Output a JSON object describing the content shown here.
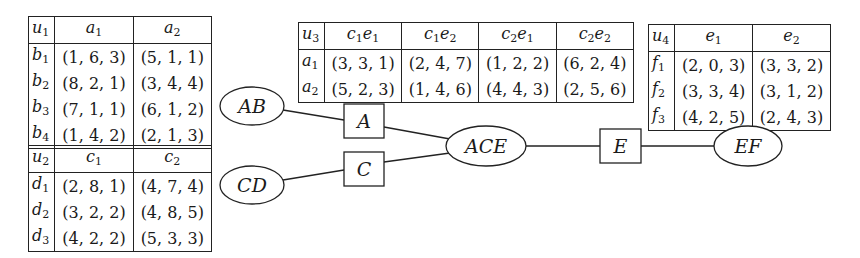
{
  "tables": [
    {
      "id": "u1",
      "corner": {
        "base": "u",
        "sub": "1"
      },
      "columns": [
        {
          "base": "a",
          "sub": "1"
        },
        {
          "base": "a",
          "sub": "2"
        }
      ],
      "rows": [
        {
          "label": {
            "base": "b",
            "sub": "1"
          },
          "values": [
            "(1, 6, 3)",
            "(5, 1, 1)"
          ]
        },
        {
          "label": {
            "base": "b",
            "sub": "2"
          },
          "values": [
            "(8, 2, 1)",
            "(3, 4, 4)"
          ]
        },
        {
          "label": {
            "base": "b",
            "sub": "3"
          },
          "values": [
            "(7, 1, 1)",
            "(6, 1, 2)"
          ]
        },
        {
          "label": {
            "base": "b",
            "sub": "4"
          },
          "values": [
            "(1, 4, 2)",
            "(2, 1, 3)"
          ]
        }
      ]
    },
    {
      "id": "u2",
      "corner": {
        "base": "u",
        "sub": "2"
      },
      "columns": [
        {
          "base": "c",
          "sub": "1"
        },
        {
          "base": "c",
          "sub": "2"
        }
      ],
      "rows": [
        {
          "label": {
            "base": "d",
            "sub": "1"
          },
          "values": [
            "(2, 8, 1)",
            "(4, 7, 4)"
          ]
        },
        {
          "label": {
            "base": "d",
            "sub": "2"
          },
          "values": [
            "(3, 2, 2)",
            "(4, 8, 5)"
          ]
        },
        {
          "label": {
            "base": "d",
            "sub": "3"
          },
          "values": [
            "(4, 2, 2)",
            "(5, 3, 3)"
          ]
        }
      ]
    },
    {
      "id": "u3",
      "corner": {
        "base": "u",
        "sub": "3"
      },
      "columns": [
        {
          "base": "c",
          "sub": "1",
          "base2": "e",
          "sub2": "1"
        },
        {
          "base": "c",
          "sub": "1",
          "base2": "e",
          "sub2": "2"
        },
        {
          "base": "c",
          "sub": "2",
          "base2": "e",
          "sub2": "1"
        },
        {
          "base": "c",
          "sub": "2",
          "base2": "e",
          "sub2": "2"
        }
      ],
      "rows": [
        {
          "label": {
            "base": "a",
            "sub": "1"
          },
          "values": [
            "(3, 3, 1)",
            "(2, 4, 7)",
            "(1, 2, 2)",
            "(6, 2, 4)"
          ]
        },
        {
          "label": {
            "base": "a",
            "sub": "2"
          },
          "values": [
            "(5, 2, 3)",
            "(1, 4, 6)",
            "(4, 4, 3)",
            "(2, 5, 6)"
          ]
        }
      ]
    },
    {
      "id": "u4",
      "corner": {
        "base": "u",
        "sub": "4"
      },
      "columns": [
        {
          "base": "e",
          "sub": "1"
        },
        {
          "base": "e",
          "sub": "2"
        }
      ],
      "rows": [
        {
          "label": {
            "base": "f",
            "sub": "1"
          },
          "values": [
            "(2, 0, 3)",
            "(3, 3, 2)"
          ]
        },
        {
          "label": {
            "base": "f",
            "sub": "2"
          },
          "values": [
            "(3, 3, 4)",
            "(3, 1, 2)"
          ]
        },
        {
          "label": {
            "base": "f",
            "sub": "3"
          },
          "values": [
            "(4, 2, 5)",
            "(2, 4, 3)"
          ]
        }
      ]
    }
  ],
  "graph": {
    "ellipse_nodes": [
      {
        "id": "AB",
        "label": "AB",
        "cx": 252,
        "cy": 106,
        "rx": 32,
        "ry": 19
      },
      {
        "id": "CD",
        "label": "CD",
        "cx": 252,
        "cy": 185,
        "rx": 32,
        "ry": 19
      },
      {
        "id": "ACE",
        "label": "ACE",
        "cx": 486,
        "cy": 146,
        "rx": 40,
        "ry": 20
      },
      {
        "id": "EF",
        "label": "EF",
        "cx": 748,
        "cy": 146,
        "rx": 34,
        "ry": 20
      }
    ],
    "box_nodes": [
      {
        "id": "A",
        "label": "A",
        "x": 344,
        "y": 104,
        "w": 40,
        "h": 34
      },
      {
        "id": "C",
        "label": "C",
        "x": 344,
        "y": 152,
        "w": 40,
        "h": 34
      },
      {
        "id": "E",
        "label": "E",
        "x": 600,
        "y": 129,
        "w": 41,
        "h": 34
      }
    ],
    "edges": [
      {
        "from": "AB",
        "to": "A",
        "x1": 283,
        "y1": 110,
        "x2": 344,
        "y2": 120
      },
      {
        "from": "A",
        "to": "ACE",
        "x1": 384,
        "y1": 127,
        "x2": 450,
        "y2": 139
      },
      {
        "from": "CD",
        "to": "C",
        "x1": 283,
        "y1": 180,
        "x2": 344,
        "y2": 170
      },
      {
        "from": "C",
        "to": "ACE",
        "x1": 384,
        "y1": 162,
        "x2": 450,
        "y2": 153
      },
      {
        "from": "ACE",
        "to": "E",
        "x1": 526,
        "y1": 146,
        "x2": 600,
        "y2": 146
      },
      {
        "from": "E",
        "to": "EF",
        "x1": 641,
        "y1": 146,
        "x2": 714,
        "y2": 146
      }
    ]
  }
}
